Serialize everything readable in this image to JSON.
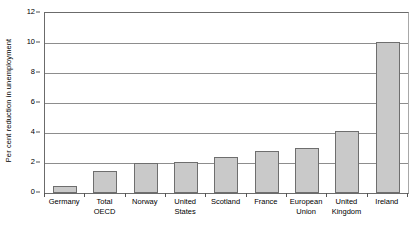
{
  "chart_data": {
    "type": "bar",
    "title": "",
    "xlabel": "",
    "ylabel": "Per cent reduction in unemployment",
    "ylim": [
      0,
      12
    ],
    "ytick_step": 2,
    "yticks": [
      0,
      2,
      4,
      6,
      8,
      10,
      12
    ],
    "grid": true,
    "legend": "none",
    "categories": [
      "Germany",
      "Total OECD",
      "Norway",
      "United\nStates",
      "Scotland",
      "France",
      "European\nUnion",
      "United\nKingdom",
      "Ireland"
    ],
    "values": [
      0.5,
      1.5,
      2.0,
      2.1,
      2.4,
      2.8,
      3.0,
      4.15,
      10.1
    ],
    "series": [
      {
        "name": "Per cent reduction in unemployment",
        "values": [
          0.5,
          1.5,
          2.0,
          2.1,
          2.4,
          2.8,
          3.0,
          4.15,
          10.1
        ]
      }
    ],
    "colors": {
      "bar_fill": "#c9c9c9",
      "bar_border": "#6e6e6e",
      "gridline": "#8d8d8d",
      "axis": "#6b6b6b",
      "text": "#000000",
      "background": "#ffffff"
    }
  }
}
